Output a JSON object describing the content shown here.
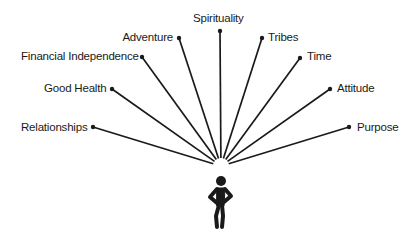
{
  "diagram": {
    "title": "",
    "colors": {
      "line": "#1a1a1a",
      "text": "#1a1a1a",
      "background": "#ffffff"
    },
    "origin": {
      "x": 221,
      "y": 166
    },
    "figure_icon": "person-standing-hands-on-hips-icon",
    "spokes": [
      {
        "id": "relationships",
        "label": "Relationships",
        "dot": [
          93,
          127
        ],
        "label_pos": [
          21,
          120
        ],
        "align": "right",
        "label_width": 66
      },
      {
        "id": "good-health",
        "label": "Good Health",
        "dot": [
          112,
          89
        ],
        "label_pos": [
          44,
          81
        ],
        "align": "right",
        "label_width": 62
      },
      {
        "id": "financial-independence",
        "label": "Financial Independence",
        "dot": [
          142,
          57
        ],
        "label_pos": [
          21,
          49
        ],
        "align": "right",
        "label_width": 114
      },
      {
        "id": "adventure",
        "label": "Adventure",
        "dot": [
          179,
          38
        ],
        "label_pos": [
          122,
          30
        ],
        "align": "right",
        "label_width": 51
      },
      {
        "id": "spirituality",
        "label": "Spirituality",
        "dot": [
          220,
          31
        ],
        "label_pos": [
          193,
          11
        ],
        "align": "left",
        "label_width": 56
      },
      {
        "id": "tribes",
        "label": "Tribes",
        "dot": [
          262,
          38
        ],
        "label_pos": [
          268,
          30
        ],
        "align": "left",
        "label_width": 30
      },
      {
        "id": "time",
        "label": "Time",
        "dot": [
          300,
          58
        ],
        "label_pos": [
          307,
          49
        ],
        "align": "left",
        "label_width": 25
      },
      {
        "id": "attitude",
        "label": "Attitude",
        "dot": [
          330,
          89
        ],
        "label_pos": [
          337,
          81
        ],
        "align": "left",
        "label_width": 42
      },
      {
        "id": "purpose",
        "label": "Purpose",
        "dot": [
          349,
          127
        ],
        "label_pos": [
          357,
          120
        ],
        "align": "left",
        "label_width": 42
      }
    ]
  }
}
